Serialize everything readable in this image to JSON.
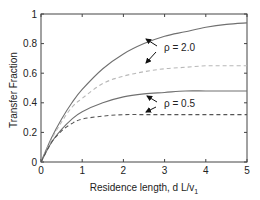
{
  "chart_data": {
    "type": "line",
    "title": "",
    "xlabel": "Residence length, d L/v",
    "xlabel_subscript": "1",
    "ylabel": "Transfer Fraction",
    "xlim": [
      0,
      5
    ],
    "ylim": [
      0,
      1
    ],
    "xticks": [
      "0",
      "1",
      "2",
      "3",
      "4",
      "5"
    ],
    "yticks": [
      "0",
      "0.2",
      "0.4",
      "0.6",
      "0.8",
      "1"
    ],
    "grid": false,
    "legend": null,
    "x": [
      0,
      0.25,
      0.5,
      0.75,
      1,
      1.5,
      2,
      2.5,
      3,
      3.5,
      4,
      4.5,
      5
    ],
    "series": [
      {
        "name": "rho=2.0 solid",
        "style": "solid",
        "color": "#707070",
        "values": [
          0,
          0.16,
          0.29,
          0.4,
          0.49,
          0.63,
          0.73,
          0.8,
          0.85,
          0.88,
          0.91,
          0.93,
          0.94
        ]
      },
      {
        "name": "rho=2.0 dashed",
        "style": "dashed",
        "color": "#b8b8b8",
        "values": [
          0,
          0.15,
          0.27,
          0.37,
          0.43,
          0.53,
          0.58,
          0.61,
          0.63,
          0.64,
          0.65,
          0.65,
          0.65
        ]
      },
      {
        "name": "rho=0.5 solid",
        "style": "solid",
        "color": "#707070",
        "values": [
          0,
          0.13,
          0.22,
          0.29,
          0.34,
          0.4,
          0.44,
          0.46,
          0.47,
          0.48,
          0.48,
          0.48,
          0.48
        ]
      },
      {
        "name": "rho=0.5 dashed",
        "style": "dashed",
        "color": "#555555",
        "values": [
          0,
          0.13,
          0.21,
          0.26,
          0.29,
          0.31,
          0.32,
          0.32,
          0.32,
          0.32,
          0.32,
          0.32,
          0.32
        ]
      }
    ],
    "annotations": [
      {
        "text": "ρ = 2.0",
        "x": 3.0,
        "y": 0.77,
        "points_to": [
          "rho=2.0 solid",
          "rho=2.0 dashed"
        ]
      },
      {
        "text": "ρ = 0.5",
        "x": 3.0,
        "y": 0.39,
        "points_to": [
          "rho=0.5 solid",
          "rho=0.5 dashed"
        ]
      }
    ]
  }
}
